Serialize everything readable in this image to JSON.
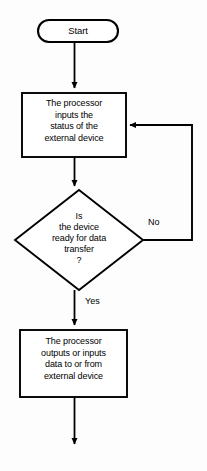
{
  "diagram": {
    "background_color": "#fdfdfd",
    "stroke_color": "#000000",
    "fill_color": "#ffffff",
    "nodes": {
      "start": {
        "shape": "terminator",
        "label": "Start"
      },
      "process_input_status": {
        "shape": "process",
        "label": "The processor\ninputs the\nstatus of the\nexternal device",
        "lines": [
          "The processor",
          "inputs the",
          "status of the",
          "external device"
        ]
      },
      "decision_ready": {
        "shape": "decision",
        "label": "Is\nthe device\nready for data\ntransfer\n?",
        "lines": [
          "Is",
          "the device",
          "ready for data",
          "transfer",
          "?"
        ]
      },
      "process_transfer_data": {
        "shape": "process",
        "label": "The processor\noutputs or inputs\ndata to or from\nexternal device",
        "lines": [
          "The processor",
          "outputs or inputs",
          "data to or from",
          "external device"
        ]
      }
    },
    "edges": {
      "start_to_input": {
        "label": ""
      },
      "input_to_decision": {
        "label": ""
      },
      "decision_no": {
        "label": "No"
      },
      "decision_yes": {
        "label": "Yes"
      },
      "transfer_to_exit": {
        "label": ""
      }
    }
  }
}
